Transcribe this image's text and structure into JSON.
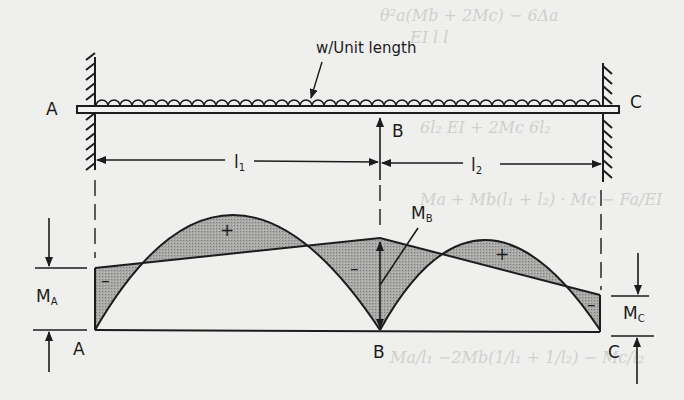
{
  "figure": {
    "type": "continuous beam with bending moment diagram",
    "load_label": "w/Unit length",
    "supports": [
      {
        "id": "A",
        "label": "A",
        "type": "fixed"
      },
      {
        "id": "B",
        "label": "B",
        "type": "simple"
      },
      {
        "id": "C",
        "label": "C",
        "type": "fixed"
      }
    ],
    "spans": [
      {
        "label": "l",
        "subscript": "1",
        "from": "A",
        "to": "B"
      },
      {
        "label": "l",
        "subscript": "2",
        "from": "B",
        "to": "C"
      }
    ],
    "moment_labels": {
      "MA": {
        "main": "M",
        "sub": "A"
      },
      "MB": {
        "main": "M",
        "sub": "B"
      },
      "MC": {
        "main": "M",
        "sub": "C"
      }
    },
    "bmd_points": {
      "A": "A",
      "B": "B",
      "C": "C"
    },
    "signs": {
      "span1_left": "–",
      "span1_mid": "+",
      "support_B": "–",
      "span2_mid": "+",
      "span2_right": "–"
    }
  },
  "background_text": {
    "faint_1": "θ²a(Mb + 2Mc) − 6Δa",
    "faint_2": "EI    l        l",
    "faint_3": "6l₂    EI + 2Mc  6l₂",
    "faint_4": "Ma + Mb(l₁ + l₂)  ·  Mc − Fa/EI",
    "faint_5": "Ma/l₁  −2Mb(1/l₁ + 1/l₂) − Mc/l₂"
  }
}
